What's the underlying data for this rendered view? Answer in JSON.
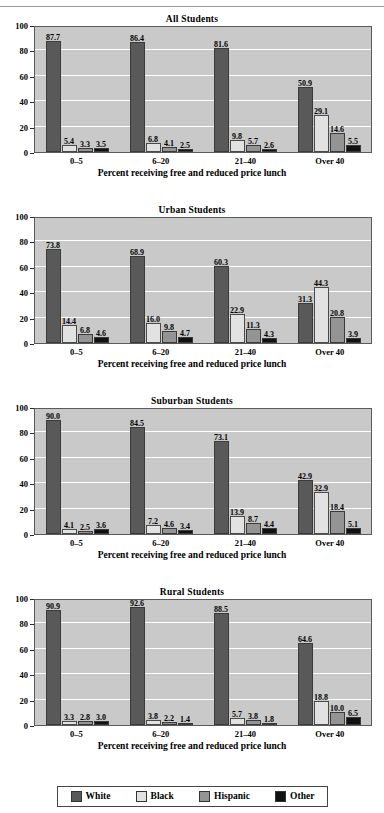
{
  "legend": {
    "items": [
      {
        "label": "White",
        "color": "#595959"
      },
      {
        "label": "Black",
        "color": "#e2e2e2"
      },
      {
        "label": "Hispanic",
        "color": "#949494"
      },
      {
        "label": "Other",
        "color": "#111111"
      }
    ]
  },
  "axis": {
    "yticks": [
      "100",
      "80",
      "60",
      "40",
      "20",
      "0"
    ],
    "xlabel": "Percent receiving free and reduced price lunch",
    "categories": [
      "0–5",
      "6–20",
      "21–40",
      "Over 40"
    ]
  },
  "chart_data": [
    {
      "type": "bar",
      "title": "All Students",
      "xlabel": "Percent receiving free and reduced price lunch",
      "ylabel": "",
      "ylim": [
        0,
        100
      ],
      "yticks": [
        0,
        20,
        40,
        60,
        80,
        100
      ],
      "grid": true,
      "legend_position": "bottom-shared",
      "categories": [
        "0–5",
        "6–20",
        "21–40",
        "Over 40"
      ],
      "series": [
        {
          "name": "White",
          "values": [
            87.7,
            86.4,
            81.6,
            50.9
          ],
          "labels": [
            "87.7",
            "86.4",
            "81.6",
            "50.9"
          ]
        },
        {
          "name": "Black",
          "values": [
            5.4,
            6.8,
            9.8,
            29.1
          ],
          "labels": [
            "5.4",
            "6.8",
            "9.8",
            "29.1"
          ]
        },
        {
          "name": "Hispanic",
          "values": [
            3.3,
            4.1,
            5.7,
            14.6
          ],
          "labels": [
            "3.3",
            "4.1",
            "5.7",
            "14.6"
          ]
        },
        {
          "name": "Other",
          "values": [
            3.5,
            2.5,
            2.6,
            5.5
          ],
          "labels": [
            "3.5",
            "2.5",
            "2.6",
            "5.5"
          ]
        }
      ]
    },
    {
      "type": "bar",
      "title": "Urban Students",
      "xlabel": "Percent receiving free and reduced price lunch",
      "ylabel": "",
      "ylim": [
        0,
        100
      ],
      "yticks": [
        0,
        20,
        40,
        60,
        80,
        100
      ],
      "grid": true,
      "legend_position": "bottom-shared",
      "categories": [
        "0–5",
        "6–20",
        "21–40",
        "Over 40"
      ],
      "series": [
        {
          "name": "White",
          "values": [
            73.8,
            68.9,
            60.3,
            31.3
          ],
          "labels": [
            "73.8",
            "68.9",
            "60.3",
            "31.3"
          ]
        },
        {
          "name": "Black",
          "values": [
            14.4,
            16.0,
            22.9,
            44.3
          ],
          "labels": [
            "14.4",
            "16.0",
            "22.9",
            "44.3"
          ]
        },
        {
          "name": "Hispanic",
          "values": [
            6.8,
            9.8,
            11.3,
            20.8
          ],
          "labels": [
            "6.8",
            "9.8",
            "11.3",
            "20.8"
          ]
        },
        {
          "name": "Other",
          "values": [
            4.6,
            4.7,
            4.3,
            3.9
          ],
          "labels": [
            "4.6",
            "4.7",
            "4.3",
            "3.9"
          ]
        }
      ]
    },
    {
      "type": "bar",
      "title": "Suburban Students",
      "xlabel": "Percent receiving free and reduced price lunch",
      "ylabel": "",
      "ylim": [
        0,
        100
      ],
      "yticks": [
        0,
        20,
        40,
        60,
        80,
        100
      ],
      "grid": true,
      "legend_position": "bottom-shared",
      "categories": [
        "0–5",
        "6–20",
        "21–40",
        "Over 40"
      ],
      "series": [
        {
          "name": "White",
          "values": [
            90.0,
            84.5,
            73.1,
            42.9
          ],
          "labels": [
            "90.0",
            "84.5",
            "73.1",
            "42.9"
          ]
        },
        {
          "name": "Black",
          "values": [
            4.1,
            7.2,
            13.9,
            32.9
          ],
          "labels": [
            "4.1",
            "7.2",
            "13.9",
            "32.9"
          ]
        },
        {
          "name": "Hispanic",
          "values": [
            2.5,
            4.6,
            8.7,
            18.4
          ],
          "labels": [
            "2.5",
            "4.6",
            "8.7",
            "18.4"
          ]
        },
        {
          "name": "Other",
          "values": [
            3.6,
            3.4,
            4.4,
            5.1
          ],
          "labels": [
            "3.6",
            "3.4",
            "4.4",
            "5.1"
          ]
        }
      ]
    },
    {
      "type": "bar",
      "title": "Rural Students",
      "xlabel": "Percent receiving free and reduced price lunch",
      "ylabel": "",
      "ylim": [
        0,
        100
      ],
      "yticks": [
        0,
        20,
        40,
        60,
        80,
        100
      ],
      "grid": true,
      "legend_position": "bottom-shared",
      "categories": [
        "0–5",
        "6–20",
        "21–40",
        "Over 40"
      ],
      "series": [
        {
          "name": "White",
          "values": [
            90.9,
            92.6,
            88.5,
            64.6
          ],
          "labels": [
            "90.9",
            "92.6",
            "88.5",
            "64.6"
          ]
        },
        {
          "name": "Black",
          "values": [
            3.3,
            3.8,
            5.7,
            18.8
          ],
          "labels": [
            "3.3",
            "3.8",
            "5.7",
            "18.8"
          ]
        },
        {
          "name": "Hispanic",
          "values": [
            2.8,
            2.2,
            3.8,
            10.0
          ],
          "labels": [
            "2.8",
            "2.2",
            "3.8",
            "10.0"
          ]
        },
        {
          "name": "Other",
          "values": [
            3.0,
            1.4,
            1.8,
            6.5
          ],
          "labels": [
            "3.0",
            "1.4",
            "1.8",
            "6.5"
          ]
        }
      ]
    }
  ]
}
